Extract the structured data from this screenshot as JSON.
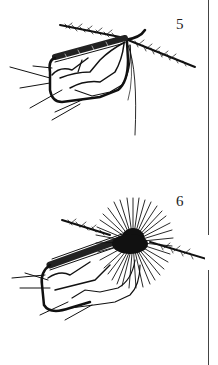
{
  "figures": [
    {
      "number": "5",
      "subject": "fly-tying step: hook with tail, body and hackle stem"
    },
    {
      "number": "6",
      "subject": "fly-tying step: hook with wound hackle collar"
    }
  ],
  "colors": {
    "ink": "#111111",
    "background": "#ffffff"
  }
}
